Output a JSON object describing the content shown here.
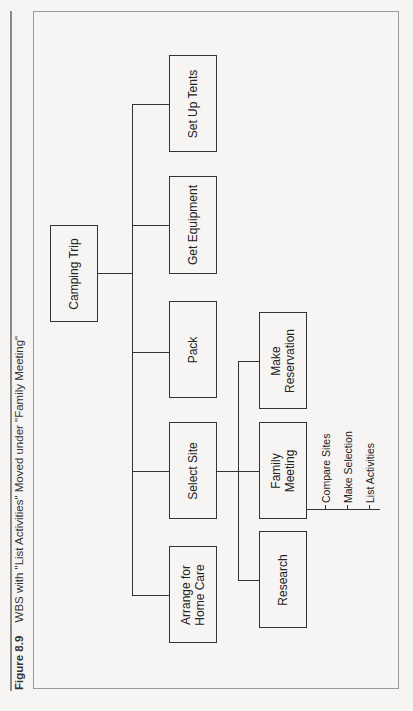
{
  "caption": {
    "figure_label": "Figure 8.9",
    "title": "WBS with \"List Activities\" Moved under \"Family Meeting\""
  },
  "wbs": {
    "root": {
      "label": "Camping Trip"
    },
    "level1": [
      {
        "label": "Set Up Tents"
      },
      {
        "label": "Get Equipment"
      },
      {
        "label": "Pack"
      },
      {
        "label": "Select Site"
      },
      {
        "label": "Arrange for\nHome Care"
      }
    ],
    "select_site_children": [
      {
        "label": "Make\nReservation"
      },
      {
        "label": "Family\nMeeting"
      },
      {
        "label": "Research"
      }
    ],
    "family_meeting_children": [
      {
        "label": "Compare Sites"
      },
      {
        "label": "Make Selection"
      },
      {
        "label": "List Activities"
      }
    ]
  },
  "colors": {
    "line": "#333333",
    "frame": "#9a9a9a",
    "background": "#f6f5f3"
  }
}
